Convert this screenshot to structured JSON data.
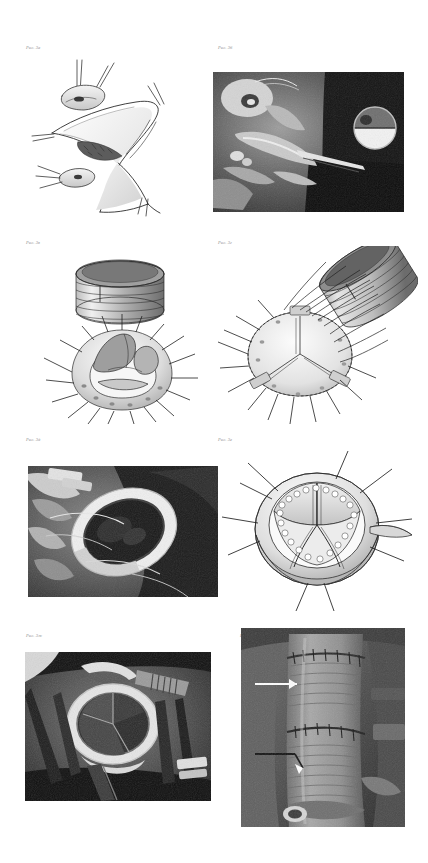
{
  "document": {
    "kind": "surgical-atlas-figure-plate",
    "background_color": "#ffffff",
    "caption_color": "#8b8b8b",
    "page_width": 428,
    "page_height": 863
  },
  "panels": [
    {
      "id": "panel-a",
      "caption": "Рис. 3а",
      "media": "line-drawing",
      "subject": "Aortotomy with traction sutures and excised valve leaflet",
      "caption_x": 26,
      "caption_y": 46,
      "frame_x": 30,
      "frame_y": 60,
      "frame_w": 175,
      "frame_h": 155
    },
    {
      "id": "panel-b",
      "caption": "Рис. 3б",
      "media": "photograph",
      "subject": "Intraoperative view of opened aortic root",
      "caption_x": 218,
      "caption_y": 46,
      "frame_x": 213,
      "frame_y": 72,
      "frame_w": 191,
      "frame_h": 140
    },
    {
      "id": "panel-c",
      "caption": "Рис. 3в",
      "media": "line-drawing",
      "subject": "Valve prosthesis held above the prepared annulus with pledgeted sutures",
      "caption_x": 26,
      "caption_y": 241,
      "frame_x": 40,
      "frame_y": 255,
      "frame_w": 165,
      "frame_h": 165
    },
    {
      "id": "panel-d",
      "caption": "Рис. 3г",
      "media": "line-drawing",
      "subject": "Prosthesis being parachuted down the suture lines into the annulus",
      "caption_x": 218,
      "caption_y": 241,
      "frame_x": 216,
      "frame_y": 248,
      "frame_w": 200,
      "frame_h": 178
    },
    {
      "id": "panel-e",
      "caption": "Рис. 3д",
      "media": "photograph",
      "subject": "Seated graft conduit in the aortic root",
      "caption_x": 26,
      "caption_y": 438,
      "frame_x": 28,
      "frame_y": 466,
      "frame_w": 190,
      "frame_h": 131
    },
    {
      "id": "panel-e2",
      "caption": "Рис. 3е",
      "media": "line-drawing",
      "subject": "Completed interrupted suture ring around the seated prosthesis",
      "caption_x": 218,
      "caption_y": 438,
      "frame_x": 222,
      "frame_y": 445,
      "frame_w": 190,
      "frame_h": 165
    },
    {
      "id": "panel-f",
      "caption": "Рис. 3ж",
      "media": "photograph",
      "subject": "Implanted prosthetic valve viewed through the aortotomy",
      "caption_x": 26,
      "caption_y": 634,
      "frame_x": 25,
      "frame_y": 652,
      "frame_w": 186,
      "frame_h": 149
    },
    {
      "id": "panel-g",
      "caption": "Рис. 3з",
      "media": "photograph",
      "subject": "Closed aortic graft with anastomoses marked by arrows",
      "caption_x": 240,
      "caption_y": 634,
      "frame_x": 241,
      "frame_y": 628,
      "frame_w": 164,
      "frame_h": 199,
      "annotations": [
        {
          "type": "arrow",
          "label": "upper anastomosis"
        },
        {
          "type": "arrow",
          "label": "lower anastomosis"
        }
      ]
    }
  ]
}
